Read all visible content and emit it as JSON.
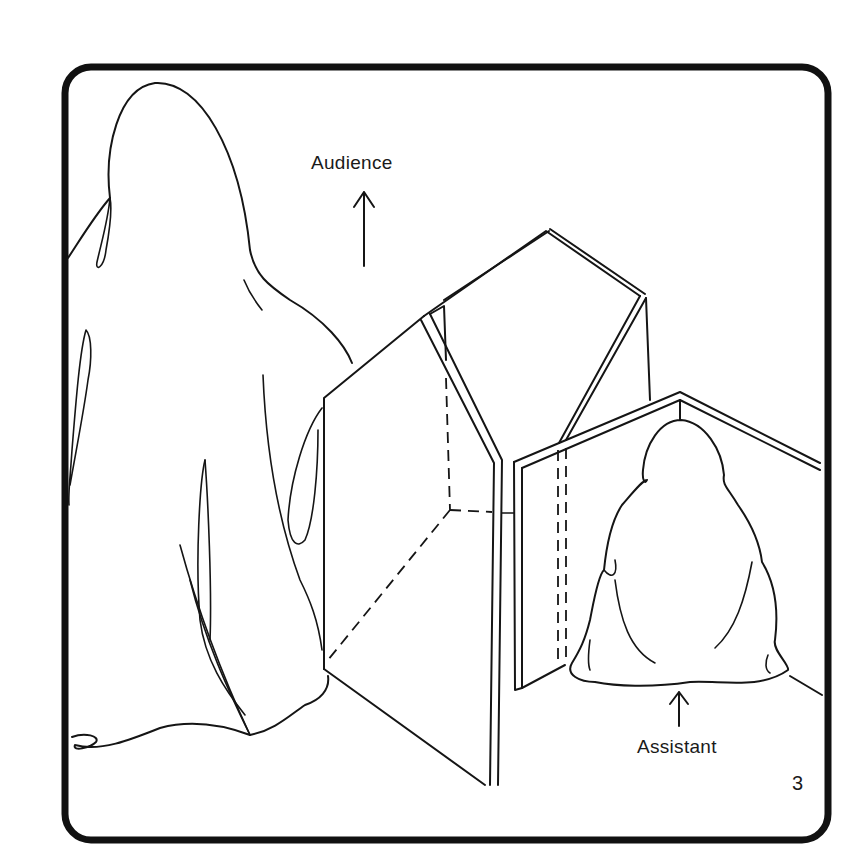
{
  "illustration": {
    "description": "Line drawing: robed performer seen from behind at left, a folding screen/cabinet prop in the center, and a seated robed assistant hidden behind a second screen at right",
    "labels": {
      "audience": "Audience",
      "assistant": "Assistant"
    },
    "page_number": "3",
    "arrows": [
      {
        "name": "audience-arrow",
        "direction": "up"
      },
      {
        "name": "assistant-arrow",
        "direction": "up"
      }
    ],
    "colors": {
      "ink": "#151515",
      "paper": "#ffffff"
    }
  }
}
